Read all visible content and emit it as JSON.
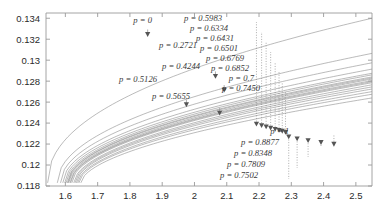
{
  "chart_data": {
    "type": "line",
    "title": "",
    "xlabel": "",
    "ylabel": "",
    "xlim": [
      1.54,
      2.55
    ],
    "ylim": [
      0.118,
      0.1345
    ],
    "grid": false,
    "legend": "none",
    "xticks": [
      1.6,
      1.7,
      1.8,
      1.9,
      2,
      2.1,
      2.2,
      2.3,
      2.4,
      2.5
    ],
    "xtick_labels": [
      "1.6",
      "1.7",
      "1.8",
      "1.9",
      "2",
      "2.1",
      "2.2",
      "2.3",
      "2.4",
      "2.5"
    ],
    "yticks": [
      0.118,
      0.12,
      0.122,
      0.124,
      0.126,
      0.128,
      0.13,
      0.132,
      0.134
    ],
    "ytick_labels": [
      "0.118",
      "0.12",
      "0.122",
      "0.124",
      "0.126",
      "0.128",
      "0.13",
      "0.132",
      "0.134"
    ],
    "annotation_prefix": "p = ",
    "series": [
      {
        "name": "p = 0",
        "p_label": "p = 0",
        "x0": 1.545,
        "y0": 0.1183,
        "yend": 0.134,
        "knee": 0.46,
        "marker_x": 1.855,
        "marker_y": 0.13245,
        "label_x": 152,
        "label_y": 23,
        "leader": false
      },
      {
        "name": "p = 0.2721",
        "p_label": "p = 0.2721",
        "x0": 1.575,
        "y0": 0.1183,
        "yend": 0.13065,
        "knee": 0.49,
        "marker_x": 2.065,
        "marker_y": 0.12845,
        "label_x": 197,
        "label_y": 48,
        "leader": false
      },
      {
        "name": "p = 0.4244",
        "p_label": "p = 0.4244",
        "x0": 1.585,
        "y0": 0.1183,
        "yend": 0.12975,
        "knee": 0.5,
        "marker_x": 2.092,
        "marker_y": 0.12715,
        "label_x": 200,
        "label_y": 69,
        "leader": false
      },
      {
        "name": "p = 0.5126",
        "p_label": "p = 0.5126",
        "x0": 1.592,
        "y0": 0.1183,
        "yend": 0.12915,
        "knee": 0.51,
        "marker_x": 1.975,
        "marker_y": 0.12575,
        "label_x": 157,
        "label_y": 82,
        "leader": false
      },
      {
        "name": "p = 0.5655",
        "p_label": "p = 0.5655",
        "x0": 1.598,
        "y0": 0.1183,
        "yend": 0.12875,
        "knee": 0.51,
        "marker_x": 2.078,
        "marker_y": 0.12495,
        "label_x": 190,
        "label_y": 99,
        "leader": false
      },
      {
        "name": "p = 0.5983",
        "p_label": "p = 0.5983",
        "x0": 1.602,
        "y0": 0.1183,
        "yend": 0.1286,
        "knee": 0.52,
        "marker_x": 2.192,
        "marker_y": 0.1239,
        "label_x": 222,
        "label_y": 21,
        "leader": true
      },
      {
        "name": "p = 0.6334",
        "p_label": "p = 0.6334",
        "x0": 1.606,
        "y0": 0.1183,
        "yend": 0.1284,
        "knee": 0.52,
        "marker_x": 2.208,
        "marker_y": 0.12375,
        "label_x": 228,
        "label_y": 31,
        "leader": true
      },
      {
        "name": "p = 0.6431",
        "p_label": "p = 0.6431",
        "x0": 1.608,
        "y0": 0.1183,
        "yend": 0.1283,
        "knee": 0.52,
        "marker_x": 2.222,
        "marker_y": 0.12363,
        "label_x": 234,
        "label_y": 41,
        "leader": true
      },
      {
        "name": "p = 0.6501",
        "p_label": "p = 0.6501",
        "x0": 1.61,
        "y0": 0.1183,
        "yend": 0.1282,
        "knee": 0.53,
        "marker_x": 2.236,
        "marker_y": 0.12352,
        "label_x": 238,
        "label_y": 51,
        "leader": true
      },
      {
        "name": "p = 0.6769",
        "p_label": "p = 0.6769",
        "x0": 1.614,
        "y0": 0.1183,
        "yend": 0.12805,
        "knee": 0.53,
        "marker_x": 2.25,
        "marker_y": 0.1234,
        "label_x": 244,
        "label_y": 61,
        "leader": true
      },
      {
        "name": "p = 0.6852",
        "p_label": "p = 0.6852",
        "x0": 1.616,
        "y0": 0.1183,
        "yend": 0.12795,
        "knee": 0.53,
        "marker_x": 2.262,
        "marker_y": 0.1233,
        "label_x": 249,
        "label_y": 71,
        "leader": true
      },
      {
        "name": "p = 0.7",
        "p_label": "p = 0.7",
        "x0": 1.62,
        "y0": 0.1183,
        "yend": 0.12785,
        "knee": 0.53,
        "marker_x": 2.272,
        "marker_y": 0.12322,
        "label_x": 254,
        "label_y": 81,
        "leader": true
      },
      {
        "name": "p = 0.7450",
        "p_label": "p = 0.7450",
        "x0": 1.626,
        "y0": 0.1183,
        "yend": 0.12765,
        "knee": 0.54,
        "marker_x": 2.282,
        "marker_y": 0.12312,
        "label_x": 260,
        "label_y": 91,
        "leader": true
      },
      {
        "name": "p = 0.7502",
        "p_label": "p = 0.7502",
        "x0": 1.63,
        "y0": 0.1183,
        "yend": 0.12745,
        "knee": 0.54,
        "marker_x": 2.292,
        "marker_y": 0.12268,
        "label_x": 258,
        "label_y": 178,
        "leader": true
      },
      {
        "name": "p = 0.7809",
        "p_label": "p = 0.7809",
        "x0": 1.634,
        "y0": 0.1183,
        "yend": 0.12725,
        "knee": 0.54,
        "marker_x": 2.318,
        "marker_y": 0.1225,
        "label_x": 265,
        "label_y": 167,
        "leader": true
      },
      {
        "name": "p = 0.8348",
        "p_label": "p = 0.8348",
        "x0": 1.638,
        "y0": 0.1183,
        "yend": 0.127,
        "knee": 0.55,
        "marker_x": 2.352,
        "marker_y": 0.12232,
        "label_x": 272,
        "label_y": 156,
        "leader": true
      },
      {
        "name": "p = 0.8877",
        "p_label": "p = 0.8877",
        "x0": 1.642,
        "y0": 0.1183,
        "yend": 0.12675,
        "knee": 0.55,
        "marker_x": 2.392,
        "marker_y": 0.12215,
        "label_x": 279,
        "label_y": 145,
        "leader": true
      },
      {
        "name": "p = 1",
        "p_label": "p = 1",
        "x0": 1.648,
        "y0": 0.1183,
        "yend": 0.1264,
        "knee": 0.56,
        "marker_x": 2.432,
        "marker_y": 0.12198,
        "label_x": 289,
        "label_y": 134,
        "leader": true
      }
    ]
  },
  "axes": {
    "plot_left": 46,
    "plot_right": 372,
    "plot_top": 13,
    "plot_bottom": 186,
    "frame_color": "#9a9a9a",
    "curve_color": "#8e8e8e",
    "marker_color": "#555555",
    "leader_color": "#8a8a8a"
  }
}
